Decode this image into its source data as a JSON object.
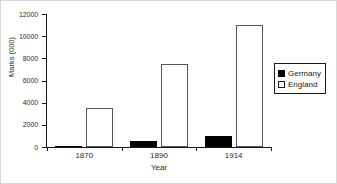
{
  "chart_data": {
    "type": "bar",
    "title": "",
    "subtitle": "",
    "xlabel": "Year",
    "ylabel": "Marks (000)",
    "categories": [
      "1870",
      "1890",
      "1914"
    ],
    "series": [
      {
        "name": "Germany",
        "color": "#000000",
        "values": [
          0,
          500,
          1000
        ]
      },
      {
        "name": "England",
        "color": "#ffffff",
        "values": [
          3500,
          7500,
          11000
        ]
      }
    ],
    "ylim": [
      0,
      12000
    ],
    "yticks": [
      0,
      2000,
      4000,
      6000,
      8000,
      10000,
      12000
    ],
    "ytick_labels": [
      "0",
      "2000",
      "4000",
      "6000",
      "8000",
      "10000",
      "12000"
    ],
    "grid": false,
    "legend_position": "right",
    "legend_entries": [
      "Germany",
      "England"
    ]
  },
  "axes": {
    "y_title": "Marks (000)",
    "x_title": "Year"
  },
  "legend": {
    "items": [
      {
        "label": "Germany"
      },
      {
        "label": "England"
      }
    ]
  }
}
